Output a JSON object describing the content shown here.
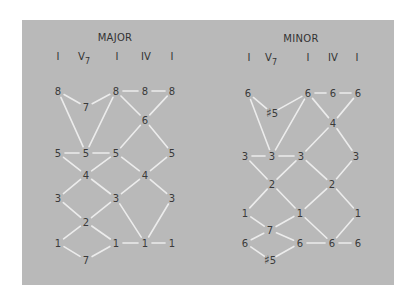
{
  "colors": {
    "panel": "#b9b9b9",
    "line": "#ececec",
    "text": "#3a3a3a",
    "page": "#ffffff"
  },
  "diagrams": [
    {
      "id": "major",
      "title": "MAJOR",
      "title_pos": [
        115,
        38
      ],
      "chords": [
        {
          "label": "I",
          "sub": "",
          "x": 58
        },
        {
          "label": "V",
          "sub": "7",
          "x": 84
        },
        {
          "label": "I",
          "sub": "",
          "x": 117
        },
        {
          "label": "IV",
          "sub": "",
          "x": 146
        },
        {
          "label": "I",
          "sub": "",
          "x": 172
        }
      ],
      "chord_y": 57,
      "nodes": [
        {
          "id": "a8",
          "label": "8",
          "x": 58,
          "y": 91
        },
        {
          "id": "b7",
          "label": "7",
          "x": 86,
          "y": 107
        },
        {
          "id": "c8",
          "label": "8",
          "x": 116,
          "y": 91
        },
        {
          "id": "d8",
          "label": "8",
          "x": 145,
          "y": 91
        },
        {
          "id": "e8",
          "label": "8",
          "x": 172,
          "y": 91
        },
        {
          "id": "d6",
          "label": "6",
          "x": 145,
          "y": 120
        },
        {
          "id": "a5",
          "label": "5",
          "x": 58,
          "y": 153
        },
        {
          "id": "b5",
          "label": "5",
          "x": 86,
          "y": 153
        },
        {
          "id": "c5",
          "label": "5",
          "x": 116,
          "y": 153
        },
        {
          "id": "e5",
          "label": "5",
          "x": 172,
          "y": 153
        },
        {
          "id": "b4",
          "label": "4",
          "x": 86,
          "y": 175
        },
        {
          "id": "d4",
          "label": "4",
          "x": 145,
          "y": 175
        },
        {
          "id": "a3",
          "label": "3",
          "x": 58,
          "y": 198
        },
        {
          "id": "c3",
          "label": "3",
          "x": 116,
          "y": 198
        },
        {
          "id": "e3",
          "label": "3",
          "x": 172,
          "y": 198
        },
        {
          "id": "b2",
          "label": "2",
          "x": 86,
          "y": 222
        },
        {
          "id": "a1",
          "label": "1",
          "x": 58,
          "y": 243
        },
        {
          "id": "c1",
          "label": "1",
          "x": 116,
          "y": 243
        },
        {
          "id": "d1",
          "label": "1",
          "x": 145,
          "y": 243
        },
        {
          "id": "e1",
          "label": "1",
          "x": 172,
          "y": 243
        },
        {
          "id": "b7low",
          "label": "7",
          "x": 86,
          "y": 260
        }
      ],
      "edges": [
        [
          "a8",
          "b7"
        ],
        [
          "b7",
          "c8"
        ],
        [
          "c8",
          "d8"
        ],
        [
          "d8",
          "e8"
        ],
        [
          "c8",
          "d6"
        ],
        [
          "d6",
          "e8"
        ],
        [
          "a8",
          "b5"
        ],
        [
          "b5",
          "c8"
        ],
        [
          "d6",
          "c5"
        ],
        [
          "d6",
          "e5"
        ],
        [
          "a5",
          "b5"
        ],
        [
          "b5",
          "c5"
        ],
        [
          "a5",
          "b4"
        ],
        [
          "b4",
          "c5"
        ],
        [
          "c5",
          "d4"
        ],
        [
          "d4",
          "e5"
        ],
        [
          "b4",
          "a3"
        ],
        [
          "b4",
          "c3"
        ],
        [
          "d4",
          "c3"
        ],
        [
          "d4",
          "e3"
        ],
        [
          "a3",
          "b2"
        ],
        [
          "b2",
          "c3"
        ],
        [
          "c3",
          "d1"
        ],
        [
          "e3",
          "d1"
        ],
        [
          "b2",
          "a1"
        ],
        [
          "b2",
          "c1"
        ],
        [
          "a1",
          "b7low"
        ],
        [
          "b7low",
          "c1"
        ],
        [
          "c1",
          "d1"
        ],
        [
          "d1",
          "e1"
        ]
      ]
    },
    {
      "id": "minor",
      "title": "MINOR",
      "title_pos": [
        301,
        39
      ],
      "chords": [
        {
          "label": "I",
          "sub": "",
          "x": 249
        },
        {
          "label": "V",
          "sub": "7",
          "x": 271
        },
        {
          "label": "I",
          "sub": "",
          "x": 308
        },
        {
          "label": "IV",
          "sub": "",
          "x": 333
        },
        {
          "label": "I",
          "sub": "",
          "x": 357
        }
      ],
      "chord_y": 58,
      "nodes": [
        {
          "id": "a6",
          "label": "6",
          "x": 248,
          "y": 93
        },
        {
          "id": "b5s",
          "label": "♯5",
          "x": 272,
          "y": 113
        },
        {
          "id": "c6",
          "label": "6",
          "x": 308,
          "y": 93
        },
        {
          "id": "d6",
          "label": "6",
          "x": 333,
          "y": 93
        },
        {
          "id": "e6",
          "label": "6",
          "x": 358,
          "y": 93
        },
        {
          "id": "d4",
          "label": "4",
          "x": 333,
          "y": 123
        },
        {
          "id": "a3",
          "label": "3",
          "x": 245,
          "y": 156
        },
        {
          "id": "b3",
          "label": "3",
          "x": 272,
          "y": 156
        },
        {
          "id": "c3",
          "label": "3",
          "x": 301,
          "y": 156
        },
        {
          "id": "e3",
          "label": "3",
          "x": 356,
          "y": 156
        },
        {
          "id": "b2",
          "label": "2",
          "x": 272,
          "y": 184
        },
        {
          "id": "d2",
          "label": "2",
          "x": 332,
          "y": 184
        },
        {
          "id": "a1",
          "label": "1",
          "x": 245,
          "y": 213
        },
        {
          "id": "c1",
          "label": "1",
          "x": 300,
          "y": 213
        },
        {
          "id": "e1",
          "label": "1",
          "x": 358,
          "y": 213
        },
        {
          "id": "b7",
          "label": "7",
          "x": 270,
          "y": 230
        },
        {
          "id": "a6low",
          "label": "6",
          "x": 245,
          "y": 243
        },
        {
          "id": "c6low",
          "label": "6",
          "x": 300,
          "y": 243
        },
        {
          "id": "d6low",
          "label": "6",
          "x": 332,
          "y": 243
        },
        {
          "id": "e6low",
          "label": "6",
          "x": 358,
          "y": 243
        },
        {
          "id": "b5slow",
          "label": "♯5",
          "x": 270,
          "y": 260
        }
      ],
      "edges": [
        [
          "a6",
          "b5s"
        ],
        [
          "b5s",
          "c6"
        ],
        [
          "c6",
          "d6"
        ],
        [
          "d6",
          "e6"
        ],
        [
          "c6",
          "d4"
        ],
        [
          "d4",
          "e6"
        ],
        [
          "a6",
          "b3"
        ],
        [
          "b3",
          "c6"
        ],
        [
          "a3",
          "b3"
        ],
        [
          "b3",
          "c3"
        ],
        [
          "d4",
          "c3"
        ],
        [
          "d4",
          "e3"
        ],
        [
          "a3",
          "b2"
        ],
        [
          "b2",
          "c3"
        ],
        [
          "c3",
          "d2"
        ],
        [
          "d2",
          "e3"
        ],
        [
          "b2",
          "a1"
        ],
        [
          "b2",
          "c1"
        ],
        [
          "d2",
          "c1"
        ],
        [
          "d2",
          "e1"
        ],
        [
          "a1",
          "b7"
        ],
        [
          "b7",
          "c1"
        ],
        [
          "a6low",
          "b7"
        ],
        [
          "b7",
          "c6low"
        ],
        [
          "a6low",
          "b5slow"
        ],
        [
          "b5slow",
          "c6low"
        ],
        [
          "c1",
          "d6low"
        ],
        [
          "d6low",
          "e1"
        ],
        [
          "c6low",
          "d6low"
        ],
        [
          "d6low",
          "e6low"
        ]
      ]
    }
  ]
}
